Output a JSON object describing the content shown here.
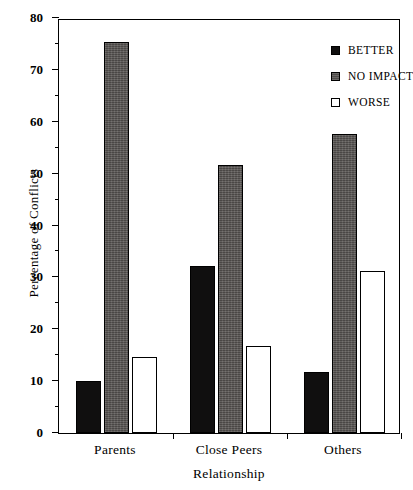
{
  "chart_data": {
    "type": "bar",
    "title": "",
    "xlabel": "Relationship",
    "ylabel": "Percentage of Conflicts",
    "categories": [
      "Parents",
      "Close Peers",
      "Others"
    ],
    "series": [
      {
        "name": "BETTER",
        "values": [
          10.0,
          32.2,
          11.7
        ]
      },
      {
        "name": "NO IMPACT",
        "values": [
          75.3,
          51.7,
          57.6
        ]
      },
      {
        "name": "WORSE",
        "values": [
          14.6,
          16.8,
          31.2
        ]
      }
    ],
    "ylim": [
      0,
      80
    ],
    "ytick_labels": [
      "0",
      "10",
      "20",
      "30",
      "40",
      "50",
      "60",
      "70",
      "80"
    ],
    "ytick_values": [
      0,
      10,
      20,
      30,
      40,
      50,
      60,
      70,
      80
    ],
    "yminor_values": [
      5,
      15,
      25,
      35,
      45,
      55,
      65,
      75
    ],
    "grid": false,
    "legend_position": "top-right",
    "colors": {
      "better": "#100f0f",
      "no_impact": "#585553",
      "worse": "#ffffff",
      "axis": "#000000"
    }
  }
}
